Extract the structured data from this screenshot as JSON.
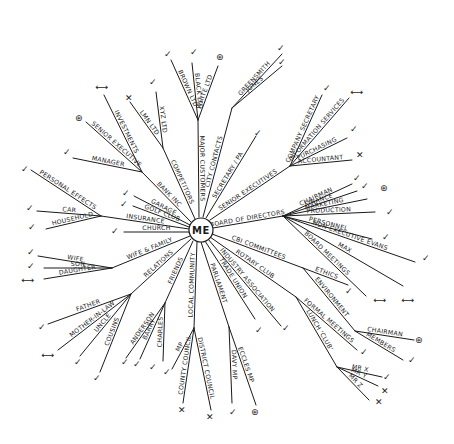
{
  "center": {
    "label": "ME",
    "x": 201,
    "y": 230,
    "r": 12
  },
  "markers": {
    "tick": "✓",
    "cross": "✕",
    "star": "⊛",
    "arrow": "⟷"
  },
  "branches": [
    {
      "id": "board",
      "label": "BOARD OF DIRECTORS",
      "from": [
        213,
        228
      ],
      "to": [
        283,
        216
      ],
      "children": [
        {
          "label": "CHAIRMAN",
          "to": [
            352,
            184
          ],
          "mark": "tick",
          "mx": 357,
          "my": 178
        },
        {
          "label": "FINANCE",
          "to": [
            357,
            191
          ],
          "mark": "tick",
          "mx": 365,
          "my": 186
        },
        {
          "label": "MARKETING",
          "to": [
            367,
            199
          ],
          "mark": "star",
          "mx": 384,
          "my": 188
        },
        {
          "label": "PRODUCTION",
          "to": [
            375,
            212
          ],
          "mark": "tick",
          "mx": 390,
          "my": 212
        },
        {
          "label": "PERSONNEL",
          "to": [
            372,
            239
          ],
          "mark": "tick",
          "mx": 386,
          "my": 237
        },
        {
          "label": "NON-EXECUTIVE EVANS",
          "to": [
            415,
            262
          ],
          "mark": "tick",
          "mx": 426,
          "my": 258
        },
        {
          "label": "MAX",
          "to": [
            403,
            286
          ],
          "mark": "arrow",
          "mx": 408,
          "my": 300
        },
        {
          "label": "BOARD MEETINGS",
          "to": [
            366,
            296
          ],
          "mark": "arrow",
          "mx": 380,
          "my": 300
        }
      ]
    },
    {
      "id": "senior-exec",
      "label": "SENIOR EXECUTIVES",
      "from": [
        210,
        220
      ],
      "to": [
        290,
        166
      ],
      "children": [
        {
          "label": "COMPANY SECRETARY",
          "to": [
            322,
            95
          ],
          "mark": "tick",
          "mx": 327,
          "my": 88
        },
        {
          "label": "INFORMATION SERVICES",
          "to": [
            349,
            98
          ],
          "mark": "arrow",
          "mx": 357,
          "my": 92
        },
        {
          "label": "PURCHASING",
          "to": [
            347,
            138
          ],
          "mark": "tick",
          "mx": 354,
          "my": 129
        },
        {
          "label": "ACCOUNTANT",
          "to": [
            352,
            160
          ],
          "mark": "cross",
          "mx": 360,
          "my": 155
        }
      ]
    },
    {
      "id": "secretary",
      "label": "SECRETARY / PA",
      "from": [
        206,
        218
      ],
      "to": [
        256,
        136
      ],
      "mark": "tick",
      "mx": 258,
      "my": 133,
      "children": []
    },
    {
      "id": "city",
      "label": "CITY CONTACTS",
      "from": [
        203,
        217
      ],
      "to": [
        232,
        108
      ],
      "children": [
        {
          "label": "GREENSMITH",
          "to": [
            282,
            54
          ],
          "mark": "tick",
          "mx": 281,
          "my": 48
        },
        {
          "label": "JONES",
          "to": [
            282,
            66
          ],
          "mark": "tick",
          "mx": 282,
          "my": 62
        }
      ]
    },
    {
      "id": "customers",
      "label": "MAJOR CUSTOMERS",
      "from": [
        199,
        217
      ],
      "to": [
        198,
        120
      ],
      "children": [
        {
          "label": "BROWN LTD",
          "to": [
            171,
            60
          ],
          "mark": "tick",
          "mx": 168,
          "my": 54
        },
        {
          "label": "BLACK LTD",
          "to": [
            192,
            63
          ],
          "mark": "tick",
          "mx": 194,
          "my": 52
        },
        {
          "label": "WHITE LTD",
          "to": [
            218,
            66
          ],
          "mark": "star",
          "mx": 220,
          "my": 57
        }
      ]
    },
    {
      "id": "competitors",
      "label": "COMPETITORS",
      "from": [
        195,
        219
      ],
      "to": [
        163,
        148
      ],
      "children": [
        {
          "label": "XYZ LTD",
          "to": [
            156,
            92
          ],
          "mark": "tick",
          "mx": 153,
          "my": 82
        },
        {
          "label": "LMN LTD",
          "to": [
            130,
            102
          ],
          "mark": "cross",
          "mx": 129,
          "my": 98
        }
      ]
    },
    {
      "id": "bank",
      "label": "BANK INC",
      "from": [
        191,
        222
      ],
      "to": [
        142,
        172
      ],
      "children": [
        {
          "label": "INVESTMENTS",
          "to": [
            104,
            95
          ],
          "mark": "arrow",
          "mx": 102,
          "my": 87
        },
        {
          "label": "SENIOR EXECUTIVE",
          "to": [
            86,
            122
          ],
          "mark": "star",
          "mx": 79,
          "my": 118
        },
        {
          "label": "MANAGER",
          "to": [
            73,
            158
          ],
          "mark": "tick",
          "mx": 67,
          "my": 152
        }
      ]
    },
    {
      "id": "garage",
      "label": "GARAGE",
      "from": [
        190,
        225
      ],
      "to": [
        134,
        196
      ],
      "mark": "tick",
      "mx": 126,
      "my": 193,
      "children": []
    },
    {
      "id": "golf",
      "label": "GOLF CLUB",
      "from": [
        189,
        227
      ],
      "to": [
        133,
        206
      ],
      "mark": "tick",
      "mx": 124,
      "my": 204,
      "children": []
    },
    {
      "id": "insurance",
      "label": "INSURANCE",
      "from": [
        189,
        229
      ],
      "to": [
        101,
        216
      ],
      "children": [
        {
          "label": "PERSONAL EFFECTS",
          "to": [
            31,
            170
          ],
          "mark": "tick",
          "mx": 25,
          "my": 169
        },
        {
          "label": "CAR",
          "to": [
            37,
            211
          ],
          "mark": "tick",
          "mx": 30,
          "my": 208
        },
        {
          "label": "HOUSEHOLD",
          "to": [
            46,
            229
          ],
          "mark": "tick",
          "mx": 32,
          "my": 227
        }
      ]
    },
    {
      "id": "church",
      "label": "CHURCH",
      "from": [
        189,
        232
      ],
      "to": [
        124,
        232
      ],
      "mark": "tick",
      "mx": 115,
      "my": 231,
      "children": []
    },
    {
      "id": "family",
      "label": "WIFE & FAMILY",
      "from": [
        190,
        236
      ],
      "to": [
        112,
        268
      ],
      "children": [
        {
          "label": "WIFE",
          "to": [
            38,
            256
          ],
          "mark": "tick",
          "mx": 31,
          "my": 252
        },
        {
          "label": "SON",
          "to": [
            44,
            268
          ],
          "mark": "tick",
          "mx": 31,
          "my": 266
        },
        {
          "label": "DAUGHTER",
          "to": [
            44,
            279
          ],
          "mark": "arrow",
          "mx": 28,
          "my": 280
        }
      ]
    },
    {
      "id": "relations",
      "label": "RELATIONS",
      "from": [
        191,
        239
      ],
      "to": [
        131,
        294
      ],
      "children": [
        {
          "label": "FATHER",
          "to": [
            48,
            324
          ],
          "mark": "tick",
          "mx": 42,
          "my": 327
        },
        {
          "label": "MOTHER-IN-LAW",
          "to": [
            58,
            350
          ],
          "mark": "arrow",
          "mx": 48,
          "my": 355
        },
        {
          "label": "UNCLE",
          "to": [
            80,
            356
          ],
          "mark": "tick",
          "mx": 78,
          "my": 362
        },
        {
          "label": "COUSINS",
          "to": [
            100,
            372
          ],
          "mark": "tick",
          "mx": 97,
          "my": 378
        }
      ]
    },
    {
      "id": "friends",
      "label": "FRIENDS",
      "from": [
        193,
        241
      ],
      "to": [
        165,
        303
      ],
      "children": [
        {
          "label": "ANDERSON",
          "to": [
            126,
            358
          ],
          "mark": "tick",
          "mx": 125,
          "my": 362
        },
        {
          "label": "BARRY",
          "to": [
            140,
            359
          ],
          "mark": "tick",
          "mx": 137,
          "my": 364
        },
        {
          "label": "CHARLES",
          "to": [
            163,
            361
          ],
          "mark": "tick",
          "mx": 153,
          "my": 367
        }
      ]
    },
    {
      "id": "local",
      "label": "LOCAL COMMUNITY",
      "from": [
        197,
        242
      ],
      "to": [
        194,
        328
      ],
      "children": [
        {
          "label": "MP",
          "to": [
            172,
            369
          ],
          "mark": "tick",
          "mx": 167,
          "my": 372
        },
        {
          "label": "COUNTY COUNCIL",
          "to": [
            183,
            403
          ],
          "mark": "cross",
          "mx": 182,
          "my": 410
        },
        {
          "label": "DISTRICT COUNCIL",
          "to": [
            211,
            410
          ],
          "mark": "cross",
          "mx": 210,
          "my": 417
        }
      ]
    },
    {
      "id": "parliament",
      "label": "PARLIAMENT",
      "from": [
        201,
        242
      ],
      "to": [
        229,
        327
      ],
      "children": [
        {
          "label": "DAVY MP",
          "to": [
            232,
            403
          ],
          "mark": "tick",
          "mx": 233,
          "my": 412
        },
        {
          "label": "ECCLES MP",
          "to": [
            256,
            405
          ],
          "mark": "star",
          "mx": 255,
          "my": 412
        }
      ]
    },
    {
      "id": "union",
      "label": "TRADE UNION",
      "from": [
        205,
        241
      ],
      "to": [
        255,
        319
      ],
      "mark": "tick",
      "mx": 259,
      "my": 330,
      "children": []
    },
    {
      "id": "industry",
      "label": "INDUSTRY ASSOCIATION",
      "from": [
        208,
        239
      ],
      "to": [
        281,
        326
      ],
      "mark": "tick",
      "mx": 286,
      "my": 328,
      "children": []
    },
    {
      "id": "rotary",
      "label": "ROTARY CLUB",
      "from": [
        210,
        237
      ],
      "to": [
        296,
        297
      ],
      "children": [
        {
          "label": "FORMAL MEETINGS",
          "to": [
            357,
            350
          ],
          "mark": "tick",
          "mx": 364,
          "my": 352
        },
        {
          "label": "LUNCH 'CLUB'",
          "to": [
            337,
            367
          ],
          "children": [
            {
              "label": "MR X",
              "to": [
                382,
                377
              ],
              "mark": "tick",
              "mx": 387,
              "my": 377
            },
            {
              "label": "MR Y",
              "to": [
                378,
                386
              ],
              "mark": "cross",
              "mx": 385,
              "my": 391
            },
            {
              "label": "MR Z",
              "to": [
                369,
                400
              ],
              "mark": "cross",
              "mx": 379,
              "my": 402
            }
          ]
        }
      ]
    },
    {
      "id": "cbi",
      "label": "CBI COMMITTEES",
      "from": [
        212,
        234
      ],
      "to": [
        303,
        268
      ],
      "children": [
        {
          "label": "ETHICS",
          "to": [
            348,
            285
          ],
          "mark": "tick",
          "mx": 349,
          "my": 291
        },
        {
          "label": "ENVIRONMENT",
          "to": [
            355,
            331
          ],
          "children": [
            {
              "label": "CHAIRMAN",
              "to": [
                414,
                340
              ],
              "mark": "star",
              "mx": 419,
              "my": 340
            },
            {
              "label": "MEMBERS",
              "to": [
                403,
                360
              ],
              "mark": "tick",
              "mx": 412,
              "my": 360
            }
          ]
        }
      ]
    }
  ]
}
